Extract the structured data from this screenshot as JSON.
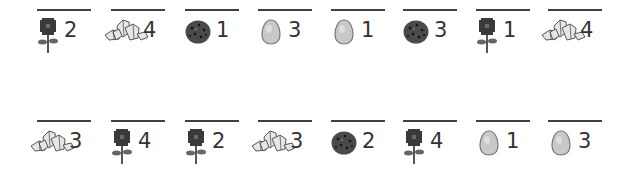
{
  "rows": [
    {
      "cells": [
        {
          "icon": "rose",
          "count": "2"
        },
        {
          "icon": "crystals",
          "count": "4"
        },
        {
          "icon": "cookie",
          "count": "1"
        },
        {
          "icon": "egg",
          "count": "3"
        },
        {
          "icon": "egg",
          "count": "1"
        },
        {
          "icon": "cookie",
          "count": "3"
        },
        {
          "icon": "rose",
          "count": "1"
        },
        {
          "icon": "crystals",
          "count": "4"
        }
      ]
    },
    {
      "cells": [
        {
          "icon": "crystals",
          "count": "3"
        },
        {
          "icon": "rose",
          "count": "4"
        },
        {
          "icon": "rose",
          "count": "2"
        },
        {
          "icon": "crystals",
          "count": "3"
        },
        {
          "icon": "cookie",
          "count": "2"
        },
        {
          "icon": "rose",
          "count": "4"
        },
        {
          "icon": "egg",
          "count": "1"
        },
        {
          "icon": "egg",
          "count": "3"
        }
      ]
    }
  ],
  "colors": {
    "line": "#404040",
    "text": "#333333",
    "rose": "#3a3a3a",
    "cookie": "#4a4a4a",
    "egg": "#c8c8c8",
    "crystal": "#e6e6e6"
  }
}
